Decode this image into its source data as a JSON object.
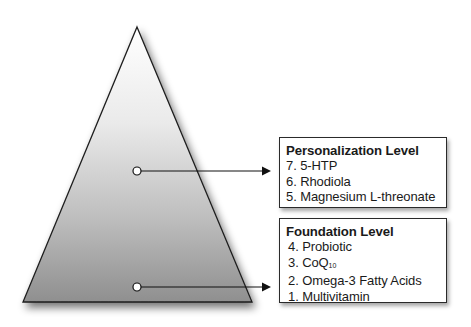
{
  "diagram": {
    "shape": "pyramid",
    "fill_gradient": {
      "top": "#ffffff",
      "bottom": "#8f8f8f"
    },
    "stroke": "#1e1e1e",
    "markers": [
      {
        "level": "personalization",
        "x": 137,
        "y": 171
      },
      {
        "level": "foundation",
        "x": 137,
        "y": 287
      }
    ]
  },
  "personalization": {
    "title": "Personalization Level",
    "items": [
      {
        "number": "7.",
        "name": "5-HTP"
      },
      {
        "number": "6.",
        "name": "Rhodiola"
      },
      {
        "number": "5.",
        "name": "Magnesium L-threonate"
      }
    ]
  },
  "foundation": {
    "title": "Foundation Level",
    "items": [
      {
        "number": "4.",
        "name": "Probiotic"
      },
      {
        "number": "3.",
        "name": "CoQ",
        "subscript": "10"
      },
      {
        "number": "2.",
        "name": "Omega-3 Fatty Acids"
      },
      {
        "number": "1.",
        "name": "Multivitamin"
      }
    ]
  }
}
